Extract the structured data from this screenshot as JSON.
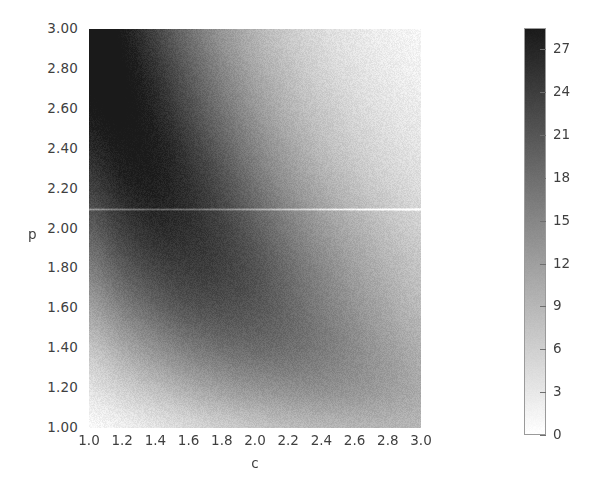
{
  "figure": {
    "width": 594,
    "height": 497,
    "background": "#ffffff"
  },
  "axes": {
    "xlabel": "c",
    "ylabel": "p",
    "xticks": [
      "1.0",
      "1.2",
      "1.4",
      "1.6",
      "1.8",
      "2.0",
      "2.2",
      "2.4",
      "2.6",
      "2.8",
      "3.0"
    ],
    "yticks": [
      "3.00",
      "2.80",
      "2.60",
      "2.40",
      "2.20",
      "2.00",
      "1.80",
      "1.60",
      "1.40",
      "1.20",
      "1.00"
    ]
  },
  "colorbar": {
    "ticks": [
      "27",
      "24",
      "21",
      "18",
      "15",
      "12",
      "9",
      "6",
      "3",
      "0"
    ],
    "vmin": 0,
    "vmax": 28.5,
    "cmap_low_color": "#ffffff",
    "cmap_high_color": "#1a1a1a",
    "orientation": "vertical",
    "position": "right"
  },
  "chart_data": {
    "type": "heatmap",
    "title": "",
    "xlabel": "c",
    "ylabel": "p",
    "xlim": [
      1.0,
      3.0
    ],
    "ylim": [
      1.0,
      3.0
    ],
    "zlim": [
      0,
      28.5
    ],
    "grid": false,
    "legend_position": "right-colorbar",
    "colormap": "gray_reversed",
    "x_tick_values": [
      1.0,
      1.2,
      1.4,
      1.6,
      1.8,
      2.0,
      2.2,
      2.4,
      2.6,
      2.8,
      3.0
    ],
    "y_tick_values": [
      1.0,
      1.2,
      1.4,
      1.6,
      1.8,
      2.0,
      2.2,
      2.4,
      2.6,
      2.8,
      3.0
    ],
    "colorbar_tick_values": [
      0,
      3,
      6,
      9,
      12,
      15,
      18,
      21,
      24,
      27
    ],
    "noise_amplitude": 1.2,
    "artifact_line": {
      "orientation": "horizontal",
      "p_value": 2.1,
      "color": "#f2f2f2",
      "description": "faint light horizontal streak spanning full plot width"
    },
    "annotations": [
      "darkest values (>27) occur in the upper-left corner near c=1.0, p=3.0",
      "a dark hyperbolic ridge band runs from upper-left to lower-right",
      "values decay toward near-zero in the lower-left corner and the upper-right corner"
    ],
    "x_samples": [
      1.0,
      1.2,
      1.4,
      1.6,
      1.8,
      2.0,
      2.2,
      2.4,
      2.6,
      2.8,
      3.0
    ],
    "y_samples": [
      3.0,
      2.8,
      2.6,
      2.4,
      2.2,
      2.0,
      1.8,
      1.6,
      1.4,
      1.2,
      1.0
    ],
    "z_grid": [
      [
        28.5,
        26.0,
        22.0,
        17.5,
        13.0,
        9.5,
        6.5,
        4.5,
        3.0,
        2.0,
        1.2
      ],
      [
        27.5,
        26.5,
        23.5,
        19.5,
        15.0,
        11.0,
        8.0,
        5.5,
        3.8,
        2.6,
        1.8
      ],
      [
        26.0,
        26.5,
        24.5,
        21.0,
        17.0,
        13.0,
        9.5,
        7.0,
        5.0,
        3.5,
        2.5
      ],
      [
        24.0,
        25.5,
        25.0,
        22.5,
        19.0,
        15.0,
        11.5,
        8.5,
        6.3,
        4.6,
        3.4
      ],
      [
        21.5,
        24.0,
        24.5,
        23.0,
        20.5,
        17.0,
        13.5,
        10.5,
        8.0,
        6.0,
        4.5
      ],
      [
        18.5,
        21.5,
        23.0,
        22.5,
        21.0,
        18.5,
        15.5,
        12.5,
        10.0,
        7.8,
        6.0
      ],
      [
        15.0,
        18.5,
        20.5,
        21.0,
        20.5,
        19.0,
        16.5,
        14.0,
        11.5,
        9.3,
        7.4
      ],
      [
        11.0,
        14.5,
        17.0,
        18.5,
        18.5,
        17.8,
        16.2,
        14.2,
        12.2,
        10.2,
        8.4
      ],
      [
        7.0,
        10.0,
        12.5,
        14.3,
        15.2,
        15.3,
        14.7,
        13.5,
        12.0,
        10.4,
        8.9
      ],
      [
        3.5,
        5.6,
        7.5,
        9.2,
        10.4,
        11.0,
        11.1,
        10.8,
        10.1,
        9.2,
        8.1
      ],
      [
        0.8,
        1.8,
        3.0,
        4.2,
        5.2,
        6.0,
        6.5,
        6.7,
        6.6,
        6.3,
        5.8
      ]
    ]
  }
}
